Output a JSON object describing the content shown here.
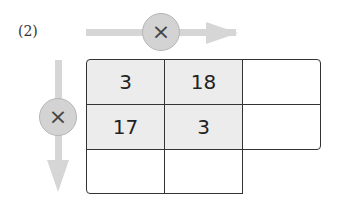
{
  "problem_label": "(2)",
  "horizontal_operator": {
    "symbol": "×",
    "icon": "multiply-icon"
  },
  "vertical_operator": {
    "symbol": "×",
    "icon": "multiply-icon"
  },
  "grid": {
    "rows": [
      [
        "3",
        "18",
        ""
      ],
      [
        "17",
        "3",
        ""
      ],
      [
        "",
        "",
        null
      ]
    ],
    "shaded_cells": [
      [
        0,
        0
      ],
      [
        0,
        1
      ],
      [
        1,
        0
      ],
      [
        1,
        1
      ]
    ],
    "colors": {
      "shade": "#ececec",
      "border": "#333333",
      "arrow": "#d6d6d6",
      "circle": "#d3d3d3"
    }
  }
}
